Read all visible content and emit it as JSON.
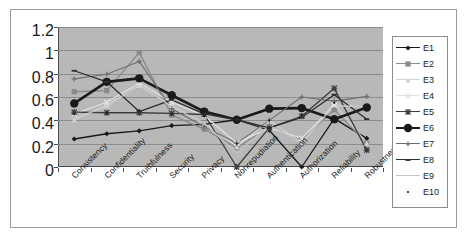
{
  "chart_data": {
    "type": "line",
    "title": "",
    "xlabel": "",
    "ylabel": "",
    "ylim": [
      0,
      1.2
    ],
    "ytick_step": 0.2,
    "grid": true,
    "legend_position": "right",
    "plot_background": "#b8b8b8",
    "categories": [
      "Consistency",
      "Confidentiality",
      "Truthfulness",
      "Security",
      "Privacy",
      "Nonrepudiation",
      "Authentication",
      "Authorization",
      "Reliability",
      "Robustness"
    ],
    "ytick_labels": [
      "0",
      "0.2",
      "0.4",
      "0.6",
      "0.8",
      "1",
      "1.2"
    ],
    "ytick_values": [
      0,
      0.2,
      0.4,
      0.6,
      0.8,
      1,
      1.2
    ],
    "series": [
      {
        "name": "E1",
        "color": "#1a1a1a",
        "marker": "diamond",
        "width": 1.3,
        "values": [
          0.24,
          0.285,
          0.31,
          0.355,
          0.365,
          0.405,
          0.315,
          0.0,
          0.415,
          0.245
        ]
      },
      {
        "name": "E2",
        "color": "#8a8a8a",
        "marker": "square",
        "width": 1.3,
        "values": [
          0.645,
          0.655,
          0.98,
          0.445,
          0.325,
          0.165,
          0.345,
          0.235,
          0.49,
          0.205
        ]
      },
      {
        "name": "E3",
        "color": "#d2d2d2",
        "marker": "triangle",
        "width": 1.3,
        "values": [
          0.405,
          0.53,
          0.7,
          0.525,
          0.375,
          0.175,
          0.4,
          0.205,
          0.545,
          0.205
        ]
      },
      {
        "name": "E4",
        "color": "#e2e2e2",
        "marker": "x",
        "width": 1.3,
        "values": [
          0.455,
          0.555,
          0.72,
          0.555,
          0.44,
          0.205,
          0.335,
          0.245,
          0.53,
          0.515
        ]
      },
      {
        "name": "E5",
        "color": "#3c3c3c",
        "marker": "star",
        "width": 1.3,
        "values": [
          0.47,
          0.465,
          0.465,
          0.46,
          0.45,
          0.0,
          0.335,
          0.435,
          0.675,
          0.145
        ]
      },
      {
        "name": "E6",
        "color": "#1a1a1a",
        "marker": "circle",
        "width": 2.6,
        "values": [
          0.545,
          0.73,
          0.76,
          0.615,
          0.475,
          0.405,
          0.5,
          0.505,
          0.41,
          0.51
        ]
      },
      {
        "name": "E7",
        "color": "#6e6e6e",
        "marker": "plus",
        "width": 1.1,
        "values": [
          0.755,
          0.795,
          0.905,
          0.5,
          0.345,
          0.205,
          0.4,
          0.6,
          0.565,
          0.605
        ]
      },
      {
        "name": "E8",
        "color": "#2e2e2e",
        "marker": "dash",
        "width": 1.3,
        "values": [
          0.825,
          0.73,
          0.475,
          0.575,
          0.455,
          0.405,
          0.335,
          0.425,
          0.62,
          0.41
        ]
      },
      {
        "name": "E9",
        "color": "#c4c4c4",
        "marker": "line",
        "width": 1.3,
        "values": [
          0.425,
          0.51,
          0.715,
          0.515,
          0.375,
          0.115,
          0.355,
          0.215,
          0.525,
          0.515
        ]
      },
      {
        "name": "E10",
        "color": "#1a1a1a",
        "marker": "dot",
        "width": 0,
        "values": [
          0.455,
          0.465,
          0.485,
          0.45,
          0.435,
          0.2,
          0.4,
          0.45,
          0.55,
          0.5
        ]
      }
    ]
  }
}
